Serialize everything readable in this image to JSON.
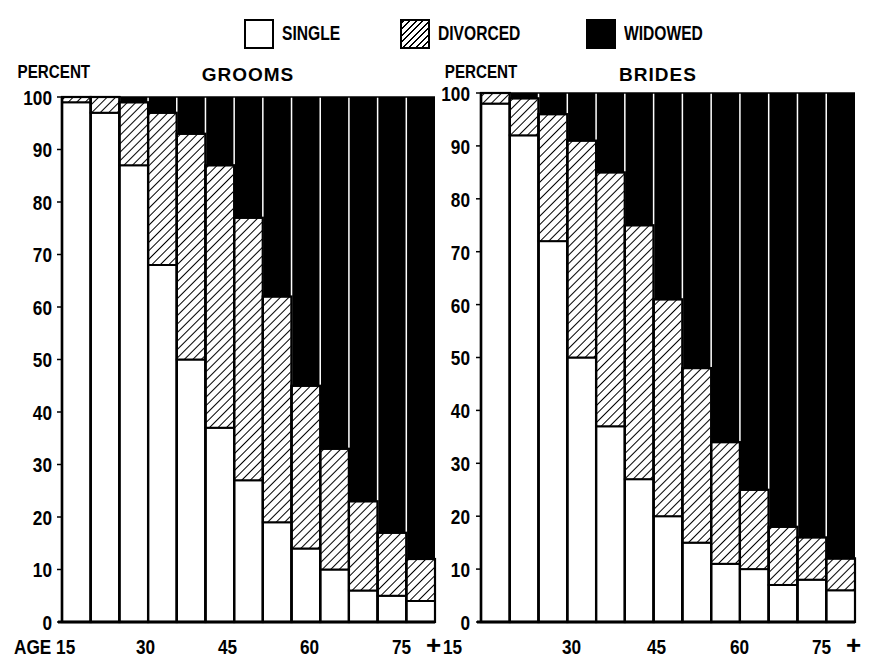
{
  "legend": {
    "items": [
      {
        "key": "single",
        "label": "SINGLE",
        "fill": "#ffffff"
      },
      {
        "key": "divorced",
        "label": "DIVORCED",
        "fill": "hatched"
      },
      {
        "key": "widowed",
        "label": "WIDOWED",
        "fill": "#000000"
      }
    ]
  },
  "chart_data": [
    {
      "type": "bar",
      "stacked": true,
      "title": "GROOMS",
      "ylabel": "PERCENT",
      "xlabel": "AGE",
      "ylim": [
        0,
        100
      ],
      "yticks": [
        0,
        10,
        20,
        30,
        40,
        50,
        60,
        70,
        80,
        90,
        100
      ],
      "xtick_labels": [
        "AGE 15",
        "30",
        "45",
        "60",
        "75 +"
      ],
      "categories": [
        "15-19",
        "20-24",
        "25-29",
        "30-34",
        "35-39",
        "40-44",
        "45-49",
        "50-54",
        "55-59",
        "60-64",
        "65-69",
        "70-74",
        "75+"
      ],
      "series": [
        {
          "name": "SINGLE",
          "values": [
            99,
            97,
            87,
            68,
            50,
            37,
            27,
            19,
            14,
            10,
            6,
            5,
            4
          ]
        },
        {
          "name": "DIVORCED",
          "values": [
            1,
            3,
            12,
            29,
            43,
            50,
            50,
            43,
            31,
            23,
            17,
            12,
            8
          ]
        },
        {
          "name": "WIDOWED",
          "values": [
            0,
            0,
            1,
            3,
            7,
            13,
            23,
            38,
            55,
            67,
            77,
            83,
            88
          ]
        }
      ],
      "grid": false,
      "legend_position": "top"
    },
    {
      "type": "bar",
      "stacked": true,
      "title": "BRIDES",
      "ylabel": "PERCENT",
      "xlabel": "AGE",
      "ylim": [
        0,
        100
      ],
      "yticks": [
        0,
        10,
        20,
        30,
        40,
        50,
        60,
        70,
        80,
        90,
        100
      ],
      "xtick_labels": [
        "15",
        "30",
        "45",
        "60",
        "75 +"
      ],
      "categories": [
        "15-19",
        "20-24",
        "25-29",
        "30-34",
        "35-39",
        "40-44",
        "45-49",
        "50-54",
        "55-59",
        "60-64",
        "65-69",
        "70-74",
        "75+"
      ],
      "series": [
        {
          "name": "SINGLE",
          "values": [
            98,
            92,
            72,
            50,
            37,
            27,
            20,
            15,
            11,
            10,
            7,
            8,
            6
          ]
        },
        {
          "name": "DIVORCED",
          "values": [
            2,
            7,
            24,
            41,
            48,
            48,
            41,
            33,
            23,
            15,
            11,
            8,
            6
          ]
        },
        {
          "name": "WIDOWED",
          "values": [
            0,
            1,
            4,
            9,
            15,
            25,
            39,
            52,
            66,
            75,
            82,
            84,
            88
          ]
        }
      ],
      "grid": false,
      "legend_position": "top"
    }
  ]
}
